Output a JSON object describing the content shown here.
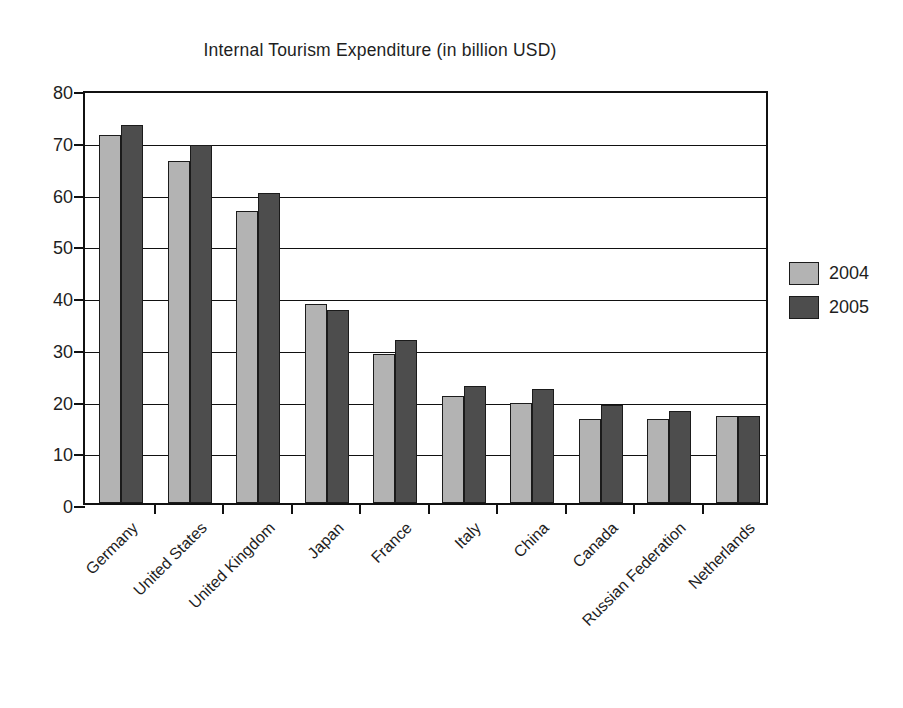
{
  "chart_data": {
    "type": "bar",
    "title": "Internal Tourism Expenditure (in billion USD)",
    "xlabel": "",
    "ylabel": "",
    "ylim": [
      0,
      80
    ],
    "ytick_step": 10,
    "yticks": [
      0,
      10,
      20,
      30,
      40,
      50,
      60,
      70,
      80
    ],
    "grid": true,
    "grid_axis": "y",
    "legend_position": "right",
    "categories": [
      "Germany",
      "United States",
      "United Kingdom",
      "Japan",
      "France",
      "Italy",
      "China",
      "Canada",
      "Russian Federation",
      "Netherlands"
    ],
    "series": [
      {
        "name": "2004",
        "color": "#b3b3b3",
        "values": [
          71.2,
          66.0,
          56.5,
          38.5,
          28.7,
          20.6,
          19.4,
          16.2,
          16.2,
          16.9
        ]
      },
      {
        "name": "2005",
        "color": "#4d4d4d",
        "values": [
          73.0,
          69.1,
          60.0,
          37.3,
          31.5,
          22.7,
          22.1,
          18.9,
          17.8,
          16.9
        ]
      }
    ]
  },
  "legend": {
    "entries": [
      {
        "label": "2004",
        "color": "#b3b3b3"
      },
      {
        "label": "2005",
        "color": "#4d4d4d"
      }
    ]
  }
}
